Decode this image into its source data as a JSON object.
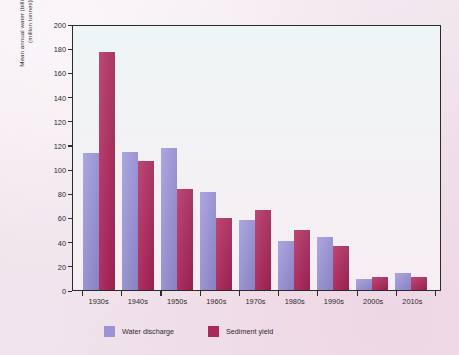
{
  "chart_data": {
    "type": "bar",
    "title": "",
    "xlabel": "",
    "ylabel": "Mean annual water (billion m³) or sediment (million tonnes) discharge",
    "ylabel_lines": [
      "Mean annual water (billion m³) or sediment",
      "(million tonnes) discharge"
    ],
    "categories": [
      "1930s",
      "1940s",
      "1950s",
      "1960s",
      "1970s",
      "1980s",
      "1990s",
      "2000s",
      "2010s"
    ],
    "series": [
      {
        "name": "Water discharge",
        "color": "#9a93d6",
        "values": [
          103,
          104,
          107,
          74,
          53,
          37,
          40,
          8,
          13
        ]
      },
      {
        "name": "Sediment yield",
        "color": "#ab2a5c",
        "values": [
          179,
          97,
          76,
          54,
          60,
          45,
          33,
          10,
          10
        ]
      }
    ],
    "ylim": [
      0,
      200
    ],
    "ytick_labels": [
      "200",
      "180",
      "160",
      "140",
      "120",
      "120",
      "100",
      "80",
      "60",
      "40",
      "20",
      "0"
    ],
    "ytick_values": [
      200,
      180,
      160,
      140,
      120,
      110,
      100,
      80,
      60,
      40,
      20,
      0
    ],
    "grid": false,
    "legend_position": "bottom-left"
  },
  "legend": {
    "items": [
      {
        "label": "Water discharge",
        "color": "#9a93d6"
      },
      {
        "label": "Sediment yield",
        "color": "#ab2a5c"
      }
    ]
  },
  "colors": {
    "water_discharge": "#9a93d6",
    "sediment_yield": "#ab2a5c",
    "axis": "#2b2b2b",
    "page_background": "#f1e4ec",
    "plot_background": "#f2f2f4"
  }
}
